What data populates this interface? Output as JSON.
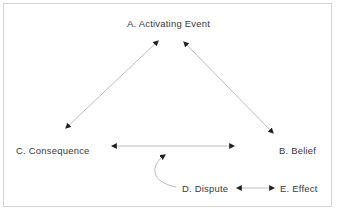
{
  "diagram": {
    "nodes": {
      "a": {
        "label": "A.  Activating  Event"
      },
      "b": {
        "label": "B.  Belief"
      },
      "c": {
        "label": "C.  Consequence"
      },
      "d": {
        "label": "D.  Dispute"
      },
      "e": {
        "label": "E.  Effect"
      }
    },
    "edges": [
      {
        "from": "A",
        "to": "C",
        "type": "bidirectional"
      },
      {
        "from": "A",
        "to": "B",
        "type": "bidirectional"
      },
      {
        "from": "C",
        "to": "B",
        "type": "bidirectional"
      },
      {
        "from": "D",
        "to": "C-B link",
        "type": "curved-arrow"
      },
      {
        "from": "D",
        "to": "E",
        "type": "bidirectional"
      }
    ],
    "colors": {
      "line": "#bdbdbd",
      "arrowhead": "#222222",
      "text": "#3a3a3a",
      "border": "#d4d4d4"
    }
  }
}
